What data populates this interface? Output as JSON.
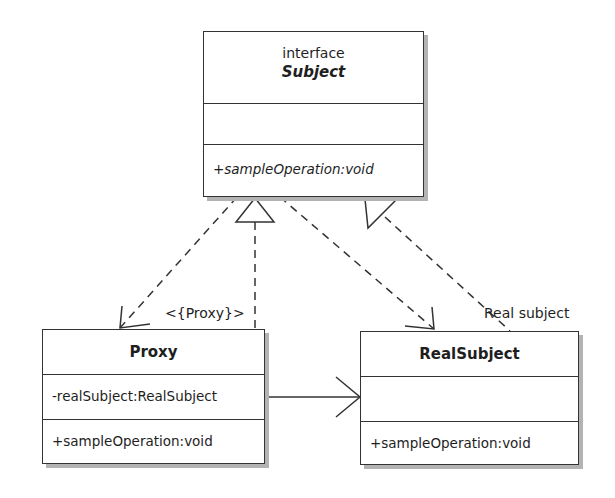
{
  "diagram": {
    "type": "UML class diagram",
    "pattern": "Proxy",
    "colors": {
      "line": "#333333",
      "shadow": "#b3b3b3",
      "background": "#ffffff",
      "text": "#1e1e1e"
    }
  },
  "classes": {
    "subject": {
      "stereotype": "interface",
      "name": "Subject",
      "attributes": [],
      "operations": [
        "+sampleOperation:void"
      ]
    },
    "proxy": {
      "name": "Proxy",
      "attributes": [
        "-realSubject:RealSubject"
      ],
      "operations": [
        "+sampleOperation:void"
      ]
    },
    "real_subject": {
      "name": "RealSubject",
      "attributes": [],
      "operations": [
        "+sampleOperation:void"
      ]
    }
  },
  "labels": {
    "proxy_role": "<{Proxy}>",
    "real_subject_role": "Real subject"
  },
  "relationships": [
    {
      "from": "Proxy",
      "to": "Subject",
      "kind": "realization"
    },
    {
      "from": "RealSubject",
      "to": "Subject",
      "kind": "realization"
    },
    {
      "from": "Subject",
      "to": "Proxy",
      "kind": "dependency"
    },
    {
      "from": "Subject",
      "to": "RealSubject",
      "kind": "dependency"
    },
    {
      "from": "Proxy",
      "to": "RealSubject",
      "kind": "association"
    }
  ]
}
